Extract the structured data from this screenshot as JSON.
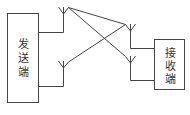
{
  "diagram": {
    "type": "block-diagram",
    "stroke_color": "#444444",
    "background": "#ffffff",
    "nodes": [
      {
        "id": "transmitter",
        "label": "发送端",
        "chars": [
          "发",
          "送",
          "端"
        ]
      },
      {
        "id": "receiver",
        "label": "接收端",
        "chars": [
          "接",
          "收",
          "端"
        ]
      }
    ],
    "antennas": [
      {
        "id": "tx-antenna-1",
        "attached_to": "transmitter"
      },
      {
        "id": "tx-antenna-2",
        "attached_to": "transmitter"
      },
      {
        "id": "rx-antenna-1",
        "attached_to": "receiver"
      },
      {
        "id": "rx-antenna-2",
        "attached_to": "receiver"
      }
    ],
    "links": [
      {
        "from": "tx-antenna-1",
        "to": "rx-antenna-1"
      },
      {
        "from": "tx-antenna-1",
        "to": "rx-antenna-2"
      },
      {
        "from": "tx-antenna-2",
        "to": "rx-antenna-1"
      }
    ]
  }
}
